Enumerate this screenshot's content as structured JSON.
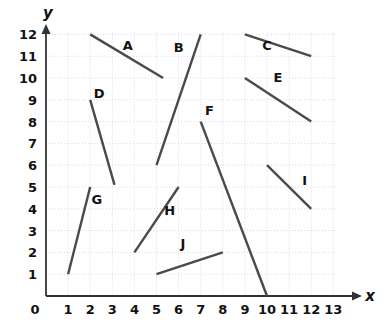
{
  "chart_data": {
    "type": "scatter",
    "title": "",
    "xlabel": "x",
    "ylabel": "y",
    "grid": true,
    "legend": "none",
    "xlim": [
      0,
      13
    ],
    "ylim": [
      0,
      12
    ],
    "x_ticks": [
      "0",
      "1",
      "2",
      "3",
      "4",
      "5",
      "6",
      "7",
      "8",
      "9",
      "10",
      "11",
      "12",
      "13"
    ],
    "y_ticks": [
      "1",
      "2",
      "3",
      "4",
      "5",
      "6",
      "7",
      "8",
      "9",
      "10",
      "11",
      "12"
    ],
    "segment_color": "#4a4a4a",
    "axis_color": "#333333",
    "grid_color": "#d8d8e8",
    "segments": [
      {
        "label": "A",
        "x1": 2.0,
        "y1": 12.0,
        "x2": 5.3,
        "y2": 10.0,
        "label_x": 3.7,
        "label_y": 11.3
      },
      {
        "label": "B",
        "x1": 5.0,
        "y1": 6.0,
        "x2": 7.0,
        "y2": 12.0,
        "label_x": 6.0,
        "label_y": 11.2
      },
      {
        "label": "C",
        "x1": 9.0,
        "y1": 12.0,
        "x2": 12.0,
        "y2": 11.0,
        "label_x": 10.0,
        "label_y": 11.3
      },
      {
        "label": "D",
        "x1": 2.0,
        "y1": 9.0,
        "x2": 3.1,
        "y2": 5.1,
        "label_x": 2.4,
        "label_y": 9.1
      },
      {
        "label": "E",
        "x1": 9.0,
        "y1": 10.0,
        "x2": 12.0,
        "y2": 8.0,
        "label_x": 10.5,
        "label_y": 9.8
      },
      {
        "label": "F",
        "x1": 7.0,
        "y1": 8.0,
        "x2": 10.0,
        "y2": 0.0,
        "label_x": 7.4,
        "label_y": 8.3
      },
      {
        "label": "G",
        "x1": 1.0,
        "y1": 1.0,
        "x2": 2.0,
        "y2": 5.0,
        "label_x": 2.3,
        "label_y": 4.2
      },
      {
        "label": "H",
        "x1": 4.0,
        "y1": 2.0,
        "x2": 6.0,
        "y2": 5.0,
        "label_x": 5.6,
        "label_y": 3.7
      },
      {
        "label": "I",
        "x1": 10.0,
        "y1": 6.0,
        "x2": 12.0,
        "y2": 4.0,
        "label_x": 11.7,
        "label_y": 5.1
      },
      {
        "label": "J",
        "x1": 5.0,
        "y1": 1.0,
        "x2": 8.0,
        "y2": 2.0,
        "label_x": 6.2,
        "label_y": 2.2
      }
    ]
  }
}
